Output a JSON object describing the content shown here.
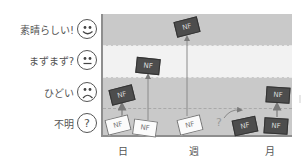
{
  "diagram": {
    "y_levels": [
      {
        "label": "素晴らしい!",
        "icon": "smiley-face-icon",
        "y": 29
      },
      {
        "label": "まずまず?",
        "icon": "neutral-face-icon",
        "y": 60
      },
      {
        "label": "ひどい",
        "icon": "frown-face-icon",
        "y": 92
      },
      {
        "label": "不明",
        "icon": "question-mark-icon",
        "y": 123
      }
    ],
    "face_glyphs": {
      "question": "?"
    },
    "x_labels": [
      {
        "label": "日",
        "x": 123
      },
      {
        "label": "週",
        "x": 194
      },
      {
        "label": "月",
        "x": 270
      }
    ],
    "cards": [
      {
        "text": "NF",
        "style": "white",
        "x": 106,
        "y": 117,
        "rotate": -14
      },
      {
        "text": "NF",
        "style": "white",
        "x": 133,
        "y": 120,
        "rotate": 8
      },
      {
        "text": "NF",
        "style": "white",
        "x": 178,
        "y": 117,
        "rotate": -14
      },
      {
        "text": "NF",
        "style": "dark",
        "x": 110,
        "y": 87,
        "rotate": -14
      },
      {
        "text": "NF",
        "style": "dark",
        "x": 136,
        "y": 58,
        "rotate": 6
      },
      {
        "text": "NF",
        "style": "dark",
        "x": 175,
        "y": 19,
        "rotate": -14
      },
      {
        "text": "NF",
        "style": "dark",
        "x": 233,
        "y": 118,
        "rotate": -12
      },
      {
        "text": "NF",
        "style": "dark",
        "x": 264,
        "y": 118,
        "rotate": 4
      },
      {
        "text": "NF",
        "style": "dark",
        "x": 266,
        "y": 87,
        "rotate": 4
      }
    ],
    "uncertain_mark": "?",
    "colors": {
      "band_gray": "#c9c9c9",
      "band_light": "#f2f2f2",
      "card_dark": "#4d4d4d",
      "card_white": "#fbfbfb",
      "arrow": "#8a8a8a"
    }
  }
}
